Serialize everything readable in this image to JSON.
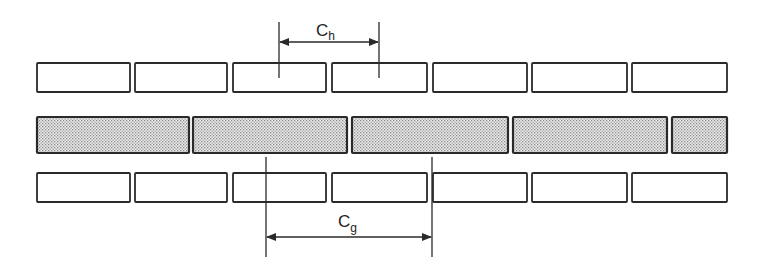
{
  "diagram": {
    "colors": {
      "stroke": "#2a2a2a",
      "fill_plain": "#ffffff",
      "fill_shaded": "#d8d8d8"
    },
    "top_row": {
      "y": 63,
      "h": 29,
      "boxes": [
        [
          37,
          130
        ],
        [
          135,
          227
        ],
        [
          233,
          326
        ],
        [
          332,
          427
        ],
        [
          433,
          527
        ],
        [
          532,
          627
        ],
        [
          632,
          727
        ]
      ]
    },
    "middle_row": {
      "y": 117,
      "h": 36,
      "shaded": true,
      "boxes": [
        [
          37,
          189
        ],
        [
          193,
          347
        ],
        [
          352,
          508
        ],
        [
          513,
          667
        ],
        [
          672,
          727
        ]
      ]
    },
    "bottom_row": {
      "y": 173,
      "h": 29,
      "boxes": [
        [
          37,
          130
        ],
        [
          135,
          227
        ],
        [
          233,
          326
        ],
        [
          332,
          427
        ],
        [
          433,
          527
        ],
        [
          532,
          627
        ],
        [
          632,
          727
        ]
      ]
    },
    "dimension_top": {
      "label_main": "C",
      "label_sub": "h",
      "x1": 279,
      "x2": 379,
      "line_top": 22,
      "line_bottom": 78,
      "arrow_y": 42
    },
    "dimension_bottom": {
      "label_main": "C",
      "label_sub": "g",
      "x1": 266,
      "x2": 432,
      "line_top": 157,
      "line_bottom": 257,
      "arrow_y": 237
    }
  }
}
